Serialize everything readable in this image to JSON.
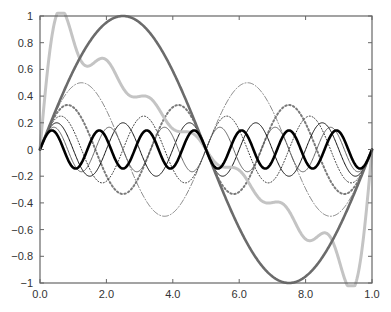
{
  "chart_data": {
    "type": "line",
    "title": "",
    "xlabel": "",
    "ylabel": "",
    "xlim": [
      0,
      10
    ],
    "ylim": [
      -1,
      1
    ],
    "grid": false,
    "legend": null,
    "x_ticks": [
      0,
      2,
      4,
      6,
      8,
      10
    ],
    "x_tick_labels": [
      "0.0",
      "2.0",
      "4.0",
      "6.0",
      "8.0",
      "1.0"
    ],
    "y_ticks": [
      1,
      0.8,
      0.6,
      0.4,
      0.2,
      0,
      -0.2,
      -0.4,
      -0.6,
      -0.8,
      -1
    ],
    "y_tick_labels": [
      "1",
      "0.8",
      "0.6",
      "0.4",
      "0.2",
      "0",
      "−0.2",
      "−0.4",
      "−0.6",
      "−0.8",
      "−1"
    ],
    "series": [
      {
        "name": "k=1",
        "formula": "sin(pi*x/5)",
        "k": 1,
        "amplitude": 1.0,
        "color": "#6b6b6b",
        "width": 2.6,
        "dash": ""
      },
      {
        "name": "k=2",
        "formula": "sin(2*pi*x/5)/2",
        "k": 2,
        "amplitude": 0.5,
        "color": "#555555",
        "width": 0.7,
        "dash": "6,2,1,2"
      },
      {
        "name": "k=3",
        "formula": "sin(3*pi*x/5)/3",
        "k": 3,
        "amplitude": 0.333,
        "color": "#7a7a7a",
        "width": 2.0,
        "dash": "1.5,2.5"
      },
      {
        "name": "k=4",
        "formula": "sin(4*pi*x/5)/4",
        "k": 4,
        "amplitude": 0.25,
        "color": "#333333",
        "width": 1.0,
        "dash": "1,2"
      },
      {
        "name": "k=5",
        "formula": "sin(5*pi*x/5)/5",
        "k": 5,
        "amplitude": 0.2,
        "color": "#111111",
        "width": 1.0,
        "dash": ""
      },
      {
        "name": "k=6",
        "formula": "sin(6*pi*x/5)/6",
        "k": 6,
        "amplitude": 0.167,
        "color": "#555555",
        "width": 0.9,
        "dash": ""
      },
      {
        "name": "k=7",
        "formula": "sin(7*pi*x/5)/7",
        "k": 7,
        "amplitude": 0.143,
        "color": "#000000",
        "width": 2.6,
        "dash": ""
      },
      {
        "name": "sum",
        "formula": "(2/pi)*sum_{k=1..7} sin(k*pi*x/5)/k",
        "k": 0,
        "amplitude": 1.0,
        "color": "#c4c4c4",
        "width": 3.0,
        "dash": ""
      }
    ]
  },
  "plot_frame": {
    "left": 40,
    "right": 372,
    "top": 16,
    "bottom": 283,
    "axis_color": "#666666"
  }
}
